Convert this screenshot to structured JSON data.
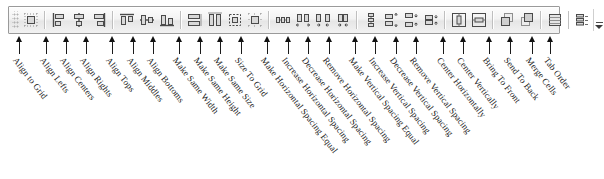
{
  "toolbar": {
    "name": "Layout Toolbar",
    "grip_label": "drag-handle",
    "overflow_label": "Toolbar Options",
    "background_color": "#f1f1f1",
    "border_color": "#9a9a9a",
    "buttons": [
      {
        "label": "Align to Grid",
        "icon": "align-to-grid-icon",
        "group": 1
      },
      {
        "label": "Align Lefts",
        "icon": "align-lefts-icon",
        "group": 2
      },
      {
        "label": "Align Centers",
        "icon": "align-centers-icon",
        "group": 2
      },
      {
        "label": "Align Rights",
        "icon": "align-rights-icon",
        "group": 2
      },
      {
        "label": "Align Tops",
        "icon": "align-tops-icon",
        "group": 3
      },
      {
        "label": "Align Middles",
        "icon": "align-middles-icon",
        "group": 3
      },
      {
        "label": "Align Bottoms",
        "icon": "align-bottoms-icon",
        "group": 3
      },
      {
        "label": "Make Same Width",
        "icon": "make-same-width-icon",
        "group": 4
      },
      {
        "label": "Make Same Height",
        "icon": "make-same-height-icon",
        "group": 4
      },
      {
        "label": "Make Same Size",
        "icon": "make-same-size-icon",
        "group": 4
      },
      {
        "label": "Size To Grid",
        "icon": "size-to-grid-icon",
        "group": 4
      },
      {
        "label": "Make Horizontal Spacing Equal",
        "icon": "make-horizontal-spacing-equal-icon",
        "group": 5
      },
      {
        "label": "Increase Horizontal Spacing",
        "icon": "increase-horizontal-spacing-icon",
        "group": 5
      },
      {
        "label": "Decrease Horizontal Spacing",
        "icon": "decrease-horizontal-spacing-icon",
        "group": 5
      },
      {
        "label": "Remove Horizontal Spacing",
        "icon": "remove-horizontal-spacing-icon",
        "group": 5
      },
      {
        "label": "Make Vertical Spacing Equal",
        "icon": "make-vertical-spacing-equal-icon",
        "group": 6
      },
      {
        "label": "Increase Vertical Spacing",
        "icon": "increase-vertical-spacing-icon",
        "group": 6
      },
      {
        "label": "Decrease Vertical Spacing",
        "icon": "decrease-vertical-spacing-icon",
        "group": 6
      },
      {
        "label": "Remove Vertical Spacing",
        "icon": "remove-vertical-spacing-icon",
        "group": 6
      },
      {
        "label": "Center Horizontally",
        "icon": "center-horizontally-icon",
        "group": 7
      },
      {
        "label": "Center Vertically",
        "icon": "center-vertically-icon",
        "group": 7
      },
      {
        "label": "Bring To Front",
        "icon": "bring-to-front-icon",
        "group": 8
      },
      {
        "label": "Send To Back",
        "icon": "send-to-back-icon",
        "group": 8
      },
      {
        "label": "Merge Cells",
        "icon": "merge-cells-icon",
        "group": 9
      },
      {
        "label": "Tab Order",
        "icon": "tab-order-icon",
        "group": 10
      }
    ]
  },
  "callouts": {
    "description": "Annotation arrows with rotated captions identifying each toolbar button",
    "arrow_color": "#111111",
    "label_color": "#1b1b1b",
    "items": [
      {
        "label": "Align to Grid",
        "x": 19
      },
      {
        "label": "Align Lefts",
        "x": 46
      },
      {
        "label": "Align Centers",
        "x": 66
      },
      {
        "label": "Align Rights",
        "x": 86
      },
      {
        "label": "Align Tops",
        "x": 112
      },
      {
        "label": "Align Middles",
        "x": 133
      },
      {
        "label": "Align Bottoms",
        "x": 153
      },
      {
        "label": "Make Same Width",
        "x": 179
      },
      {
        "label": "Make Same Height",
        "x": 200
      },
      {
        "label": "Make Same Size",
        "x": 220
      },
      {
        "label": "Size To Grid",
        "x": 241
      },
      {
        "label": "Make Horizontal Spacing Equal",
        "x": 267
      },
      {
        "label": "Increase Horizontal Spacing",
        "x": 288
      },
      {
        "label": "Decrease Horizontal Spacing",
        "x": 308
      },
      {
        "label": "Remove Horizontal Spacing",
        "x": 329
      },
      {
        "label": "Make Vertical Spacing Equal",
        "x": 355
      },
      {
        "label": "Increase Vertical Spacing",
        "x": 375
      },
      {
        "label": "Decrease Vertical Spacing",
        "x": 396
      },
      {
        "label": "Remove Vertical Spacing",
        "x": 416
      },
      {
        "label": "Center Horizontally",
        "x": 443
      },
      {
        "label": "Center Vertically",
        "x": 463
      },
      {
        "label": "Bring To Front",
        "x": 489
      },
      {
        "label": "Send To Back",
        "x": 510
      },
      {
        "label": "Merge Cells",
        "x": 532
      },
      {
        "label": "Tab Order",
        "x": 550
      }
    ]
  }
}
